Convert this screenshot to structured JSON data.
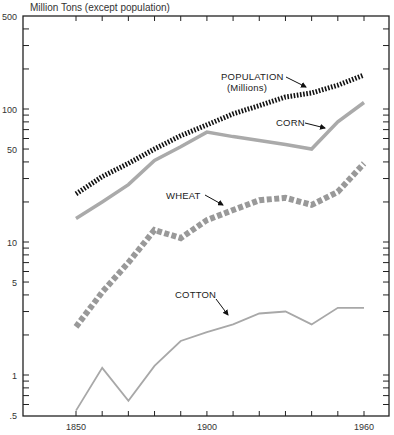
{
  "chart_data": {
    "type": "line",
    "title": "",
    "ylabel": "Million Tons (except population)",
    "xlabel": "",
    "yscale": "log",
    "ylim": [
      0.5,
      500
    ],
    "xlim": [
      1850,
      1960
    ],
    "yticks": [
      {
        "value": 500,
        "label": "500"
      },
      {
        "value": 100,
        "label": "100"
      },
      {
        "value": 50,
        "label": "50"
      },
      {
        "value": 10,
        "label": "10"
      },
      {
        "value": 5,
        "label": "5"
      },
      {
        "value": 1,
        "label": "1"
      },
      {
        "value": 0.5,
        "label": ".5"
      }
    ],
    "xticks": [
      {
        "value": 1850,
        "label": "1850"
      },
      {
        "value": 1900,
        "label": "1900"
      },
      {
        "value": 1960,
        "label": "1960"
      }
    ],
    "grid": false,
    "legend": "inline annotations with arrows",
    "series": [
      {
        "name": "POPULATION (Millions)",
        "style": "dotted-black",
        "color": "#111111",
        "x": [
          1850,
          1860,
          1870,
          1880,
          1890,
          1900,
          1910,
          1920,
          1930,
          1940,
          1950,
          1960
        ],
        "values": [
          23,
          31,
          39,
          50,
          63,
          76,
          92,
          106,
          123,
          132,
          151,
          180
        ]
      },
      {
        "name": "CORN",
        "style": "solid-thick-gray",
        "color": "#aaaaaa",
        "x": [
          1850,
          1860,
          1870,
          1880,
          1890,
          1900,
          1910,
          1920,
          1930,
          1940,
          1950,
          1960
        ],
        "values": [
          15,
          20,
          27,
          41,
          52,
          67,
          62,
          58,
          54,
          50,
          80,
          112
        ]
      },
      {
        "name": "WHEAT",
        "style": "dashed-thick-gray",
        "color": "#999999",
        "x": [
          1850,
          1860,
          1870,
          1880,
          1890,
          1900,
          1910,
          1920,
          1930,
          1940,
          1950,
          1960
        ],
        "values": [
          2.3,
          4.2,
          7.0,
          12.3,
          10.7,
          14.6,
          17.4,
          20.6,
          21.5,
          19.0,
          23.8,
          39
        ]
      },
      {
        "name": "COTTON",
        "style": "solid-thin-gray",
        "color": "#a8a8a8",
        "x": [
          1850,
          1860,
          1870,
          1880,
          1890,
          1900,
          1910,
          1920,
          1930,
          1940,
          1950,
          1960
        ],
        "values": [
          0.54,
          1.13,
          0.64,
          1.17,
          1.8,
          2.1,
          2.4,
          2.9,
          3.0,
          2.4,
          3.2,
          3.2
        ]
      }
    ],
    "annotations": [
      {
        "text": "POPULATION",
        "subtext": "(Millions)",
        "target": "POPULATION (Millions)"
      },
      {
        "text": "CORN",
        "target": "CORN"
      },
      {
        "text": "WHEAT",
        "target": "WHEAT"
      },
      {
        "text": "COTTON",
        "target": "COTTON"
      }
    ]
  }
}
